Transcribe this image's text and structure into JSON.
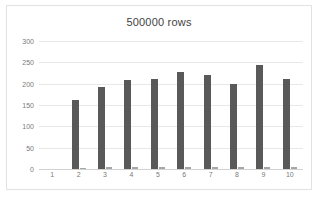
{
  "chart_data": {
    "type": "bar",
    "title": "500000 rows",
    "xlabel": "",
    "ylabel": "",
    "ylim": [
      0,
      300
    ],
    "yticks": [
      300,
      250,
      200,
      150,
      100,
      50,
      0
    ],
    "grid": true,
    "legend": "none",
    "categories": [
      "1",
      "2",
      "3",
      "4",
      "5",
      "6",
      "7",
      "8",
      "9",
      "10"
    ],
    "series": [
      {
        "name": "series-1",
        "color": "#595959",
        "values": [
          0,
          162,
          193,
          208,
          212,
          228,
          220,
          200,
          244,
          212
        ]
      },
      {
        "name": "series-2",
        "color": "#a6a6a6",
        "values": [
          0,
          3,
          4,
          4,
          4,
          5,
          4,
          4,
          5,
          5
        ]
      }
    ]
  },
  "frame": {
    "border_color": "#e2e2e2",
    "background": "#ffffff"
  }
}
